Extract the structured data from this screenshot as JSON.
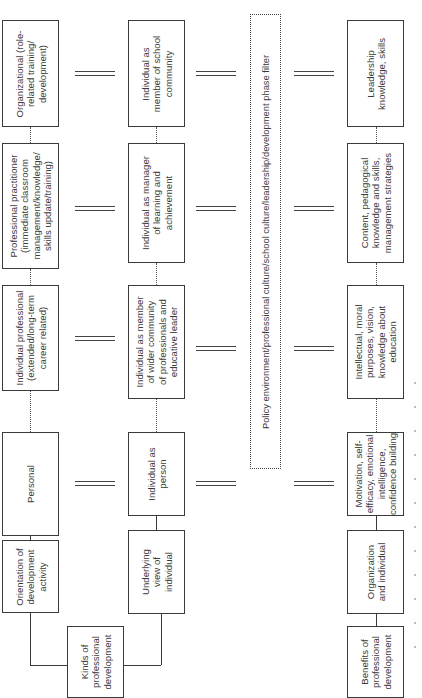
{
  "diagram": {
    "orientation": "rotated 90 degrees counter-clockwise",
    "kinds_root": "Kinds of\nprofessional\ndevelopment",
    "benefits_root": "Benefits of\nprofessional\ndevelopment",
    "orientation_column": {
      "header": "Orientation of\ndevelopment\nactivity",
      "items": [
        "Personal",
        "Individual professional\n(extended/long-term\ncareer related)",
        "Professional practitioner\n(immediate classroom\nmanagement/knowledge/\nskills update/training)",
        "Organizational (role-\nrelated training/\ndevelopment)"
      ]
    },
    "view_column": {
      "header": "Underlying\nview of\nindividual",
      "items": [
        "Individual as\nperson",
        "Individual as member\nof wider community\nof professionals and\neducative leader",
        "Individual as manager\nof learning and\nachievement",
        "Individual as\nmember of school\ncommunity"
      ]
    },
    "filter": {
      "label": "Policy environment/professional culture/school culture/leadership/development phase filter"
    },
    "benefits_column": {
      "header": "Organization\nand individual",
      "items": [
        "Motivation, self-\nefficacy, emotional\nintelligence,\nconfidence building",
        "Intellectual, moral\npurposes, vision,\nknowledge about\neducation",
        "Content, pedagogical\nknowledge and skills,\nmanagement strategies",
        "Leadership\nknowledge, skills"
      ]
    },
    "connector_symbol": "="
  }
}
